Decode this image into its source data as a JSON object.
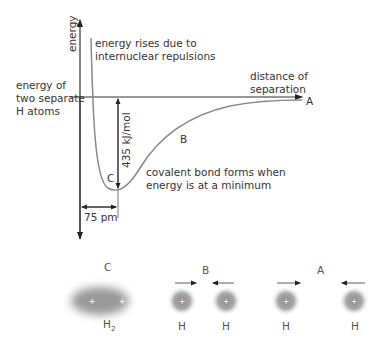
{
  "diagram": {
    "axes": {
      "y_label": "energy",
      "x_label": "distance of\nseparation"
    },
    "annotations": {
      "repulsion": "energy rises due to\ninternuclear repulsions",
      "separate_atoms": "energy of\ntwo separate\nH atoms",
      "bond_energy": "435 kJ/mol",
      "minimum": "covalent bond forms when\nenergy is at a minimum",
      "bond_length": "75 pm"
    },
    "points": {
      "A": "A",
      "B": "B",
      "C": "C"
    },
    "atoms": {
      "C": {
        "label": "C",
        "molecule": "H",
        "subscript": "2"
      },
      "B": {
        "label": "B",
        "left": "H",
        "right": "H"
      },
      "A": {
        "label": "A",
        "left": "H",
        "right": "H"
      }
    },
    "colors": {
      "axis": "#333333",
      "curve": "#888888",
      "electron_cloud": "#999999"
    }
  }
}
